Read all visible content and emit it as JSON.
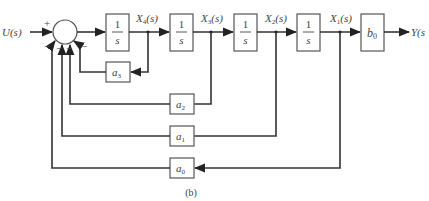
{
  "diagram": {
    "type": "block-diagram",
    "caption": "(b)",
    "input": {
      "label": "U(s)"
    },
    "output": {
      "label": "Y(s"
    },
    "summing_junction": {
      "signs": {
        "input": "+",
        "feedbacks": [
          "−",
          "−",
          "−",
          "−"
        ]
      }
    },
    "integrators": [
      {
        "id": "int1",
        "numerator": "1",
        "denominator": "s",
        "output_label": "X4(s)",
        "label_main": "X",
        "label_sub": "4",
        "label_tail": "(s)"
      },
      {
        "id": "int2",
        "numerator": "1",
        "denominator": "s",
        "output_label": "X3(s)",
        "label_main": "X",
        "label_sub": "3",
        "label_tail": "(s)"
      },
      {
        "id": "int3",
        "numerator": "1",
        "denominator": "s",
        "output_label": "X2(s)",
        "label_main": "X",
        "label_sub": "2",
        "label_tail": "(s)"
      },
      {
        "id": "int4",
        "numerator": "1",
        "denominator": "s",
        "output_label": "X1(s)",
        "label_main": "X",
        "label_sub": "1",
        "label_tail": "(s)"
      }
    ],
    "output_gain": {
      "main": "b",
      "sub": "0"
    },
    "feedback_gains": [
      {
        "main": "a",
        "sub": "3",
        "from": "X4(s)"
      },
      {
        "main": "a",
        "sub": "2",
        "from": "X3(s)"
      },
      {
        "main": "a",
        "sub": "1",
        "from": "X2(s)"
      },
      {
        "main": "a",
        "sub": "0",
        "from": "X1(s)"
      }
    ]
  }
}
